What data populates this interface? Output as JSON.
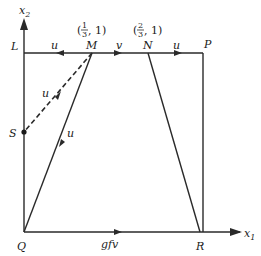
{
  "diagram": {
    "axes": {
      "x_label": "x",
      "x_sub": "1",
      "y_label": "x",
      "y_sub": "2"
    },
    "points": {
      "L": "L",
      "M": "M",
      "N": "N",
      "P": "P",
      "Q": "Q",
      "R": "R",
      "S": "S"
    },
    "coord_labels": {
      "M": {
        "num": "1",
        "den": "3",
        "tail": ", 1)"
      },
      "N": {
        "num": "2",
        "den": "3",
        "tail": ", 1)"
      }
    },
    "edge_labels": {
      "ML": "u",
      "MN": "v",
      "NP": "u",
      "MS": "u",
      "MQ": "u",
      "QR": "gfv"
    }
  }
}
